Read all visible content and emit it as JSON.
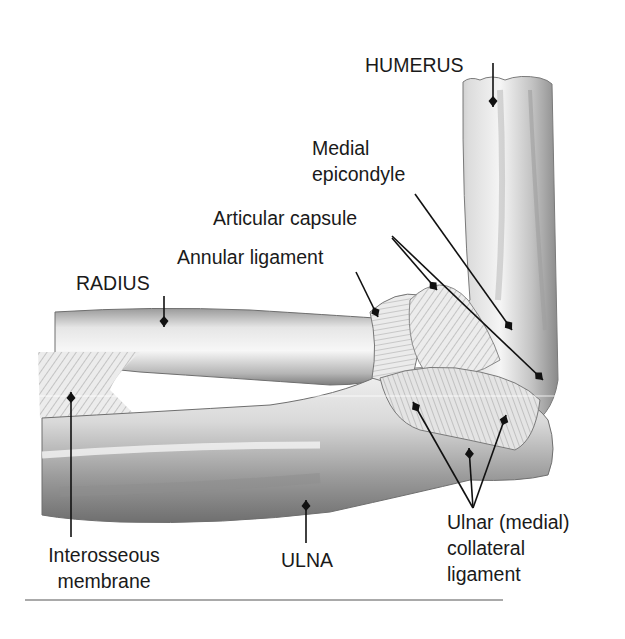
{
  "figure": {
    "background": "#ffffff",
    "ink_color": "#111111",
    "bottom_rule": {
      "x1": 25,
      "x2": 503,
      "y": 600,
      "color": "#555555"
    }
  },
  "labels": [
    {
      "id": "humerus",
      "lines": [
        "HUMERUS"
      ],
      "x": 365,
      "y": 72,
      "anchor": "start",
      "leader": [
        [
          493,
          63
        ],
        [
          493,
          107
        ]
      ]
    },
    {
      "id": "medial-epicondyle",
      "lines": [
        "Medial",
        "epicondyle"
      ],
      "x": 312,
      "y": 155,
      "anchor": "start",
      "line_height": 26,
      "leader": [
        [
          415,
          194
        ],
        [
          512,
          330
        ]
      ]
    },
    {
      "id": "articular-capsule",
      "lines": [
        "Articular capsule"
      ],
      "x": 213,
      "y": 225,
      "anchor": "start",
      "leader": [
        [
          392,
          238
        ],
        [
          437,
          290
        ]
      ],
      "leader2": [
        [
          392,
          236
        ],
        [
          543,
          380
        ]
      ]
    },
    {
      "id": "annular-ligament",
      "lines": [
        "Annular ligament"
      ],
      "x": 177,
      "y": 264,
      "anchor": "start",
      "leader": [
        [
          356,
          272
        ],
        [
          378,
          317
        ]
      ]
    },
    {
      "id": "radius",
      "lines": [
        "RADIUS"
      ],
      "x": 76,
      "y": 290,
      "anchor": "start",
      "leader": [
        [
          164,
          296
        ],
        [
          164,
          327
        ]
      ]
    },
    {
      "id": "interosseous-membrane",
      "lines": [
        "Interosseous",
        "membrane"
      ],
      "x": 104,
      "y": 562,
      "anchor": "middle",
      "line_height": 26,
      "leader": [
        [
          71,
          537
        ],
        [
          71,
          392
        ]
      ]
    },
    {
      "id": "ulna",
      "lines": [
        "ULNA"
      ],
      "x": 307,
      "y": 567,
      "anchor": "middle",
      "leader": [
        [
          306,
          543
        ],
        [
          306,
          500
        ]
      ]
    },
    {
      "id": "ulnar-collateral-ligament",
      "lines": [
        "Ulnar (medial)",
        "collateral",
        "ligament"
      ],
      "x": 447,
      "y": 529,
      "anchor": "start",
      "line_height": 26,
      "leader": [
        [
          473,
          508
        ],
        [
          413,
          402
        ]
      ],
      "leader2": [
        [
          473,
          508
        ],
        [
          469,
          448
        ]
      ],
      "leader3": [
        [
          473,
          508
        ],
        [
          506,
          415
        ]
      ]
    }
  ]
}
